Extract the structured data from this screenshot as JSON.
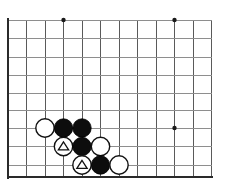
{
  "figure": {
    "kind": "go-board-diagram",
    "width_px": 229,
    "height_px": 188,
    "background_color": "#ffffff"
  },
  "board": {
    "line_color": "#5a5a5a",
    "faint_line_color": "#8e8e8e",
    "edge_color": "#2a2a2a",
    "star_point_color": "#1a1a1a",
    "origin_x": 8,
    "origin_y": 20,
    "spacing": 18.55,
    "columns": 12,
    "rows": 9,
    "left_edge_x": 8,
    "right_edge_x": 212,
    "top_edge_y": 20,
    "bottom_edge_y": 177,
    "vertical_lines_x": [
      8,
      26.5,
      45,
      63.5,
      82,
      100.5,
      119,
      137.5,
      156,
      174.5,
      193,
      211.5
    ],
    "horizontal_lines_y": [
      20,
      38.5,
      57,
      75.5,
      93,
      110.5,
      128,
      146.5,
      165,
      177
    ],
    "edges": [
      {
        "name": "left-edge",
        "x1": 8,
        "y1": 18,
        "x2": 8,
        "y2": 179
      },
      {
        "name": "bottom-edge",
        "x1": 7,
        "y1": 177,
        "x2": 213,
        "y2": 177
      }
    ]
  },
  "star_points": [
    {
      "name": "star-point-top-left",
      "x": 63.5,
      "y": 20,
      "r": 2.2
    },
    {
      "name": "star-point-top-right",
      "x": 174.5,
      "y": 20,
      "r": 2.2
    },
    {
      "name": "star-point-center-right",
      "x": 174.5,
      "y": 128,
      "r": 2.2
    }
  ],
  "stones": [
    {
      "id": "w1",
      "color": "white",
      "x": 45,
      "y": 128,
      "r": 9.2,
      "mark": "none",
      "label": ""
    },
    {
      "id": "b1",
      "color": "black",
      "x": 63.5,
      "y": 128,
      "r": 9.2,
      "mark": "none",
      "label": ""
    },
    {
      "id": "b2",
      "color": "black",
      "x": 82,
      "y": 128,
      "r": 9.2,
      "mark": "none",
      "label": ""
    },
    {
      "id": "w2",
      "color": "white",
      "x": 63.5,
      "y": 146.5,
      "r": 9.2,
      "mark": "triangle",
      "label": ""
    },
    {
      "id": "b3",
      "color": "black",
      "x": 82,
      "y": 146.5,
      "r": 9.2,
      "mark": "none",
      "label": ""
    },
    {
      "id": "w3",
      "color": "white",
      "x": 100.5,
      "y": 146.5,
      "r": 9.2,
      "mark": "none",
      "label": ""
    },
    {
      "id": "w4",
      "color": "white",
      "x": 82,
      "y": 165,
      "r": 9.2,
      "mark": "triangle",
      "label": ""
    },
    {
      "id": "b4",
      "color": "black",
      "x": 100.5,
      "y": 165,
      "r": 9.2,
      "mark": "none",
      "label": ""
    },
    {
      "id": "w5",
      "color": "white",
      "x": 119,
      "y": 165,
      "r": 9.2,
      "mark": "none",
      "label": ""
    }
  ],
  "marks": [
    {
      "name": "triangle-mark-w2",
      "on_stone": "w2",
      "x": 63.5,
      "y": 146.5,
      "size": 5.6
    },
    {
      "name": "triangle-mark-w4",
      "on_stone": "w4",
      "x": 82,
      "y": 165,
      "size": 5.6
    }
  ],
  "counts": {
    "black_stones": 4,
    "white_stones": 5,
    "marked_white_stones": 2,
    "total_stones": 9
  }
}
